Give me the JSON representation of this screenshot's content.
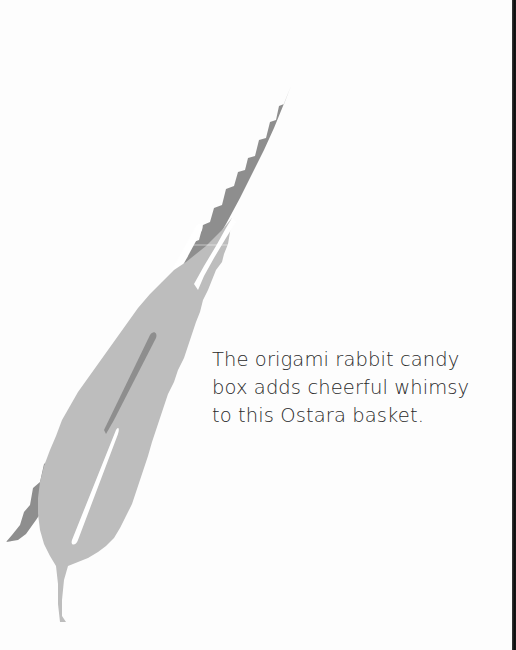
{
  "page": {
    "background": "#fdfdfd",
    "illustration": {
      "subject": "two overlapping serrated leaves",
      "dark_leaf_color": "#8c8c8c",
      "light_leaf_color": "#bdbdbd",
      "vein_color": "#ffffff"
    },
    "caption": {
      "lines": [
        "The origami rabbit candy",
        "box adds cheerful whimsy",
        "to this Ostara basket."
      ]
    },
    "edge_strip_color": "#111111"
  }
}
